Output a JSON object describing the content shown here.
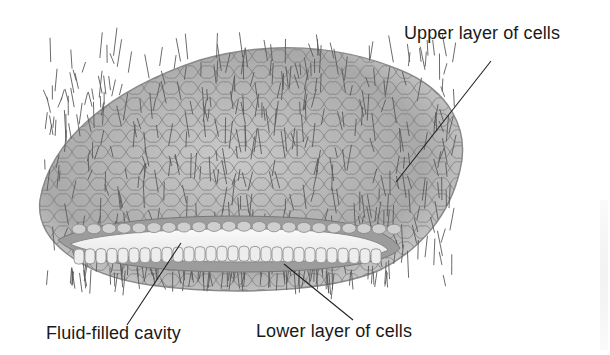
{
  "figure": {
    "colors": {
      "body_fill": "#bdbdbd",
      "cell_outline": "#6e6e6e",
      "cilia": "#5a5a5a",
      "cavity": "#f2f2f2",
      "leader_line": "#222222",
      "label_text": "#1a1a1a"
    }
  },
  "labels": [
    {
      "id": "upper",
      "text": "Upper layer of cells"
    },
    {
      "id": "fluid",
      "text": "Fluid-filled cavity"
    },
    {
      "id": "lower",
      "text": "Lower layer of cells"
    }
  ]
}
